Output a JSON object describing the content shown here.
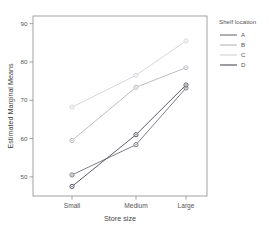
{
  "chart_data": {
    "type": "line",
    "title": "",
    "xlabel": "Store size",
    "ylabel": "Estimated Marginal Means",
    "categories": [
      "Small",
      "Medium",
      "Large"
    ],
    "ylim": [
      45,
      92
    ],
    "yticks": [
      50,
      60,
      70,
      80,
      90
    ],
    "grid": false,
    "legend_position": "right",
    "legend_title": "Shelf location",
    "series": [
      {
        "name": "A",
        "values": [
          50.5,
          58.4,
          73.2
        ],
        "color": "#6e6e78"
      },
      {
        "name": "B",
        "values": [
          59.5,
          73.4,
          78.5
        ],
        "color": "#b5b5bc"
      },
      {
        "name": "C",
        "values": [
          68.2,
          76.5,
          85.5
        ],
        "color": "#d2d2d8"
      },
      {
        "name": "D",
        "values": [
          47.5,
          61.0,
          74.0
        ],
        "color": "#4b4b57"
      }
    ]
  },
  "axes": {
    "y_tick_labels": [
      "50",
      "60",
      "70",
      "80",
      "90"
    ],
    "x_tick_labels": [
      "Small",
      "Medium",
      "Large"
    ],
    "x_title": "Store size",
    "y_title": "Estimated Marginal Means"
  },
  "legend": {
    "title": "Shelf location",
    "entries": [
      {
        "label": "A"
      },
      {
        "label": "B"
      },
      {
        "label": "C"
      },
      {
        "label": "D"
      }
    ]
  }
}
